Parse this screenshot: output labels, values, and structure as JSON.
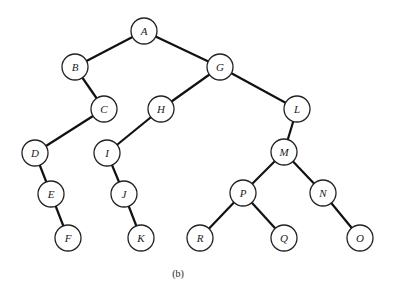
{
  "diagram": {
    "type": "binary-tree",
    "caption": "(b)",
    "node_radius": 13,
    "nodes": [
      {
        "id": "A",
        "label": "A",
        "x": 144,
        "y": 31
      },
      {
        "id": "B",
        "label": "B",
        "x": 75,
        "y": 67
      },
      {
        "id": "G",
        "label": "G",
        "x": 220,
        "y": 67
      },
      {
        "id": "C",
        "label": "C",
        "x": 104,
        "y": 109
      },
      {
        "id": "H",
        "label": "H",
        "x": 161,
        "y": 109
      },
      {
        "id": "L",
        "label": "L",
        "x": 297,
        "y": 109
      },
      {
        "id": "D",
        "label": "D",
        "x": 35,
        "y": 153
      },
      {
        "id": "I",
        "label": "I",
        "x": 107,
        "y": 153
      },
      {
        "id": "M",
        "label": "M",
        "x": 284,
        "y": 152
      },
      {
        "id": "E",
        "label": "E",
        "x": 51,
        "y": 194
      },
      {
        "id": "J",
        "label": "J",
        "x": 124,
        "y": 194
      },
      {
        "id": "P",
        "label": "P",
        "x": 243,
        "y": 193
      },
      {
        "id": "N",
        "label": "N",
        "x": 323,
        "y": 193
      },
      {
        "id": "F",
        "label": "F",
        "x": 68,
        "y": 238
      },
      {
        "id": "K",
        "label": "K",
        "x": 141,
        "y": 238
      },
      {
        "id": "R",
        "label": "R",
        "x": 200,
        "y": 238
      },
      {
        "id": "Q",
        "label": "Q",
        "x": 284,
        "y": 238
      },
      {
        "id": "O",
        "label": "O",
        "x": 360,
        "y": 238
      }
    ],
    "edges": [
      [
        "A",
        "B"
      ],
      [
        "A",
        "G"
      ],
      [
        "B",
        "C"
      ],
      [
        "C",
        "D"
      ],
      [
        "D",
        "E"
      ],
      [
        "E",
        "F"
      ],
      [
        "G",
        "H"
      ],
      [
        "G",
        "L"
      ],
      [
        "H",
        "I"
      ],
      [
        "I",
        "J"
      ],
      [
        "J",
        "K"
      ],
      [
        "L",
        "M"
      ],
      [
        "M",
        "P"
      ],
      [
        "M",
        "N"
      ],
      [
        "P",
        "R"
      ],
      [
        "P",
        "Q"
      ],
      [
        "N",
        "O"
      ]
    ]
  }
}
